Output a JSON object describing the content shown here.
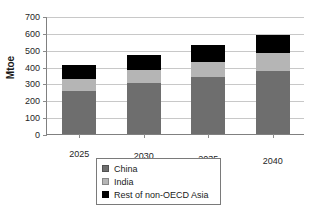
{
  "chart_data": {
    "type": "bar",
    "stacked": true,
    "title": "",
    "xlabel": "",
    "ylabel": "Mtoe",
    "categories": [
      "2025",
      "2030",
      "2035",
      "2040"
    ],
    "series": [
      {
        "name": "China",
        "color": "#6e6e6e",
        "values": [
          258,
          300,
          338,
          375
        ]
      },
      {
        "name": "India",
        "color": "#b5b5b5",
        "values": [
          69,
          78,
          90,
          105
        ]
      },
      {
        "name": "Rest of non-OECD Asia",
        "color": "#000000",
        "values": [
          83,
          90,
          100,
          108
        ]
      }
    ],
    "totals": [
      410,
      468,
      528,
      588
    ],
    "ylim": [
      0,
      700
    ],
    "ytick_values": [
      0,
      100,
      200,
      300,
      400,
      500,
      600,
      700
    ],
    "ytick_labels": [
      "0",
      "100",
      "200",
      "300",
      "400",
      "500",
      "600",
      "700"
    ],
    "grid": true,
    "legend_position": "bottom"
  },
  "legend": {
    "items": [
      {
        "label": "China",
        "color": "#6e6e6e"
      },
      {
        "label": "India",
        "color": "#b5b5b5"
      },
      {
        "label": "Rest of non-OECD Asia",
        "color": "#000000"
      }
    ]
  }
}
